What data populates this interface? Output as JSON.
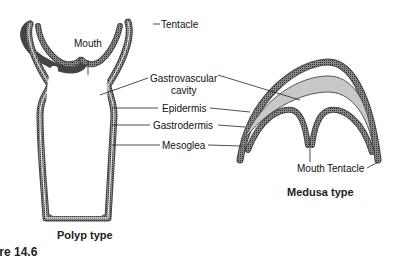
{
  "diagram": {
    "polyp": {
      "caption": "Polyp type",
      "labels": {
        "tentacle": "Tentacle",
        "mouth": "Mouth"
      }
    },
    "medusa": {
      "caption": "Medusa type",
      "labels": {
        "mouth": "Mouth",
        "tentacle": "Tentacle"
      }
    },
    "shared_labels": {
      "gastrovascular": "Gastrovascular",
      "cavity": "cavity",
      "epidermis": "Epidermis",
      "gastrodermis": "Gastrodermis",
      "mesoglea": "Mesoglea"
    },
    "figure_caption": "ure 14.6",
    "colors": {
      "wall": "#555555",
      "mesoglea_fill": "#c8c8c8",
      "background": "#ffffff"
    }
  }
}
